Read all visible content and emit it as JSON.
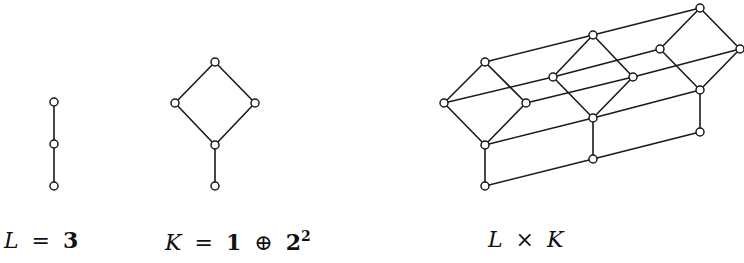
{
  "figure": {
    "diagrams": [
      {
        "id": "L",
        "label": {
          "var": "L",
          "eq": "=",
          "value": "3"
        },
        "nodes": [
          [
            54,
            102
          ],
          [
            54,
            144
          ],
          [
            54,
            186
          ]
        ],
        "edges": [
          [
            0,
            1
          ],
          [
            1,
            2
          ]
        ]
      },
      {
        "id": "K",
        "label": {
          "var": "K",
          "eq": "=",
          "one": "1",
          "oplus": "⊕",
          "two": "2",
          "exp": "2"
        },
        "nodes": [
          [
            215,
            62
          ],
          [
            175,
            103
          ],
          [
            255,
            103
          ],
          [
            215,
            145
          ],
          [
            215,
            186
          ]
        ],
        "edges": [
          [
            0,
            1
          ],
          [
            0,
            2
          ],
          [
            1,
            3
          ],
          [
            2,
            3
          ],
          [
            3,
            4
          ]
        ]
      },
      {
        "id": "LxK",
        "label": {
          "left": "L",
          "times": "×",
          "right": "K"
        },
        "copies": [
          {
            "nodes": [
              [
                485,
                62
              ],
              [
                444,
                103
              ],
              [
                526,
                103
              ],
              [
                485,
                145
              ],
              [
                485,
                186
              ]
            ]
          },
          {
            "nodes": [
              [
                593,
                35
              ],
              [
                553,
                77
              ],
              [
                633,
                77
              ],
              [
                593,
                118
              ],
              [
                593,
                159
              ]
            ]
          },
          {
            "nodes": [
              [
                700,
                8
              ],
              [
                660,
                49
              ],
              [
                740,
                49
              ],
              [
                700,
                90
              ],
              [
                700,
                132
              ]
            ]
          }
        ],
        "copy_edges": [
          [
            0,
            1
          ],
          [
            0,
            2
          ],
          [
            1,
            3
          ],
          [
            2,
            3
          ],
          [
            3,
            4
          ]
        ],
        "cross_edges": "corresponding nodes of consecutive copies"
      }
    ],
    "colors": {
      "line": "#1a1a1a",
      "node_fill": "#ffffff",
      "background": "#ffffff"
    }
  }
}
